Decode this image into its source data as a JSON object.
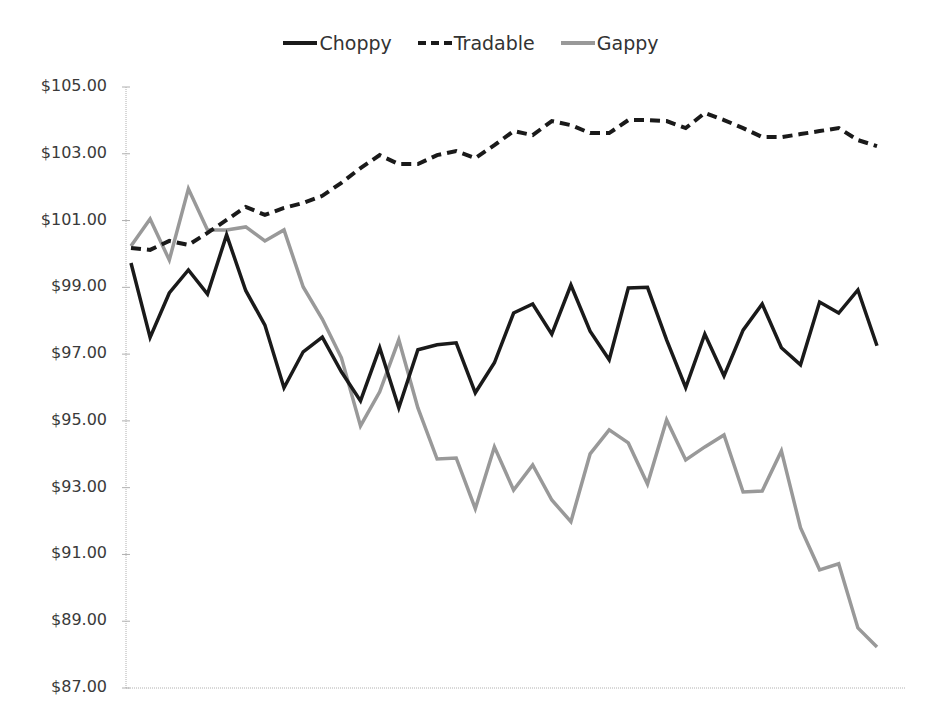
{
  "chart_data": {
    "type": "line",
    "title": "",
    "xlabel": "",
    "ylabel": "",
    "ylim": [
      87,
      105
    ],
    "yticks": [
      "$105.00",
      "$103.00",
      "$101.00",
      "$99.00",
      "$97.00",
      "$95.00",
      "$93.00",
      "$91.00",
      "$89.00",
      "$87.00"
    ],
    "ytick_values": [
      105,
      103,
      101,
      99,
      97,
      95,
      93,
      91,
      89,
      87
    ],
    "grid": false,
    "legend_position": "top",
    "x": [
      1,
      2,
      3,
      4,
      5,
      6,
      7,
      8,
      9,
      10,
      11,
      12,
      13,
      14,
      15,
      16,
      17,
      18,
      19,
      20,
      21,
      22,
      23,
      24,
      25,
      26,
      27,
      28,
      29,
      30,
      31,
      32,
      33,
      34,
      35,
      36,
      37,
      38,
      39,
      40
    ],
    "series": [
      {
        "name": "Choppy",
        "color": "#1a1a1a",
        "style": "solid",
        "values": [
          99.73,
          97.5,
          98.83,
          99.52,
          98.8,
          100.57,
          98.9,
          97.87,
          95.99,
          97.07,
          97.51,
          96.47,
          95.6,
          97.19,
          95.39,
          97.13,
          97.28,
          97.34,
          95.84,
          96.74,
          98.23,
          98.5,
          97.6,
          99.07,
          97.69,
          96.83,
          98.98,
          99.0,
          97.43,
          96.0,
          97.6,
          96.35,
          97.72,
          98.5,
          97.19,
          96.68,
          98.56,
          98.23,
          98.92,
          97.25
        ]
      },
      {
        "name": "Tradable",
        "color": "#1a1a1a",
        "style": "dashed",
        "values": [
          100.18,
          100.12,
          100.39,
          100.27,
          100.63,
          101.02,
          101.41,
          101.17,
          101.38,
          101.53,
          101.74,
          102.13,
          102.57,
          102.96,
          102.69,
          102.69,
          102.96,
          103.08,
          102.87,
          103.26,
          103.68,
          103.56,
          103.98,
          103.86,
          103.62,
          103.62,
          104.01,
          104.01,
          103.98,
          103.77,
          104.22,
          104.01,
          103.77,
          103.5,
          103.5,
          103.59,
          103.68,
          103.77,
          103.41,
          103.23
        ]
      },
      {
        "name": "Gappy",
        "color": "#999999",
        "style": "solid",
        "values": [
          100.24,
          101.05,
          99.82,
          101.95,
          100.72,
          100.72,
          100.81,
          100.39,
          100.72,
          99.01,
          98.05,
          96.89,
          94.85,
          95.87,
          97.43,
          95.39,
          93.86,
          93.89,
          92.37,
          94.22,
          92.93,
          93.68,
          92.63,
          91.98,
          94.01,
          94.73,
          94.34,
          93.11,
          95.03,
          93.83,
          94.22,
          94.58,
          92.87,
          92.9,
          94.1,
          91.8,
          90.54,
          90.72,
          88.8,
          88.23
        ]
      }
    ]
  },
  "legend": {
    "items": [
      {
        "label": "Choppy"
      },
      {
        "label": "Tradable"
      },
      {
        "label": "Gappy"
      }
    ]
  }
}
